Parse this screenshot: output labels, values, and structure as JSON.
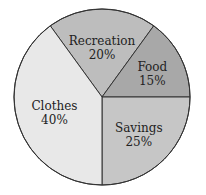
{
  "chart_data": {
    "type": "pie",
    "title": "",
    "categories": [
      "Recreation",
      "Food",
      "Savings",
      "Clothes"
    ],
    "values": [
      20,
      15,
      25,
      40
    ],
    "labels": [
      "20%",
      "15%",
      "25%",
      "40%"
    ],
    "colors": [
      "#bdbdbd",
      "#a8a8a8",
      "#c6c6c6",
      "#e8e8e8"
    ],
    "start_angle_deg_clockwise_from_top": -36,
    "legend": "none (labels inside slices)"
  },
  "slices": [
    {
      "name": "Recreation",
      "pct": "20%"
    },
    {
      "name": "Food",
      "pct": "15%"
    },
    {
      "name": "Savings",
      "pct": "25%"
    },
    {
      "name": "Clothes",
      "pct": "40%"
    }
  ]
}
